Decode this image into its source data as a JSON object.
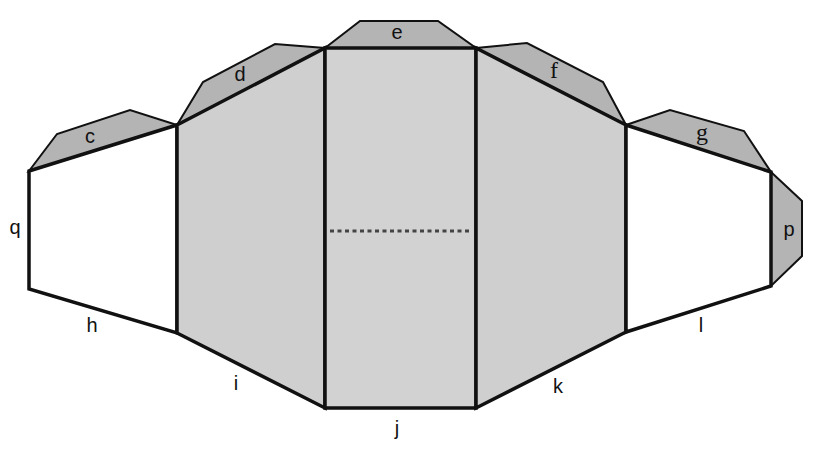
{
  "diagram": {
    "type": "net",
    "colors": {
      "flap": "#b4b4b4",
      "center_panel": "#d2d2d2",
      "inner_panel": "#cfcfcf",
      "outer_panel": "#ffffff",
      "stroke": "#111111",
      "fold_line": "#444444"
    },
    "panels": [
      {
        "id": "left-outer",
        "fill": "outer_panel"
      },
      {
        "id": "left-inner",
        "fill": "inner_panel"
      },
      {
        "id": "center",
        "fill": "center_panel"
      },
      {
        "id": "right-inner",
        "fill": "inner_panel"
      },
      {
        "id": "right-outer",
        "fill": "outer_panel"
      }
    ],
    "flaps": [
      "c",
      "d",
      "e",
      "f",
      "g",
      "p"
    ],
    "edge_labels": {
      "c": "c",
      "d": "d",
      "e": "e",
      "f": "f",
      "g": "g",
      "h": "h",
      "i": "i",
      "j": "j",
      "k": "k",
      "l": "l",
      "p": "p",
      "q": "q"
    },
    "fold_line": "dashed horizontal line across center panel"
  }
}
